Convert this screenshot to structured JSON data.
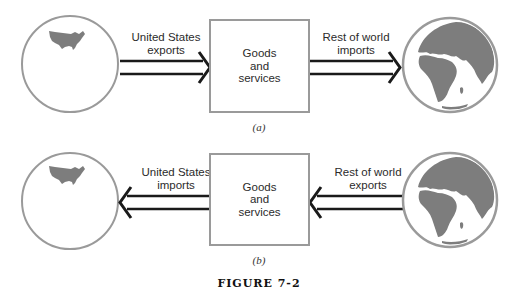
{
  "figure": {
    "caption": "FIGURE 7-2",
    "colors": {
      "outline": "#9a9a9a",
      "land": "#7d7d7d",
      "arrow": "#1a1a1a",
      "text": "#2b2b2b"
    },
    "panels": [
      {
        "id": "a",
        "label": "(a)",
        "left_node": {
          "name": "United States",
          "icon": "us-globe-icon"
        },
        "left_arrow": {
          "label_line1": "United States",
          "label_line2": "exports",
          "direction": "right"
        },
        "center_box": {
          "line1": "Goods",
          "line2": "and",
          "line3": "services"
        },
        "right_arrow": {
          "label_line1": "Rest of world",
          "label_line2": "imports",
          "direction": "right"
        },
        "right_node": {
          "name": "Rest of world",
          "icon": "world-globe-icon"
        }
      },
      {
        "id": "b",
        "label": "(b)",
        "left_node": {
          "name": "United States",
          "icon": "us-globe-icon"
        },
        "left_arrow": {
          "label_line1": "United States",
          "label_line2": "imports",
          "direction": "left"
        },
        "center_box": {
          "line1": "Goods",
          "line2": "and",
          "line3": "services"
        },
        "right_arrow": {
          "label_line1": "Rest of world",
          "label_line2": "exports",
          "direction": "left"
        },
        "right_node": {
          "name": "Rest of world",
          "icon": "world-globe-icon"
        }
      }
    ]
  }
}
